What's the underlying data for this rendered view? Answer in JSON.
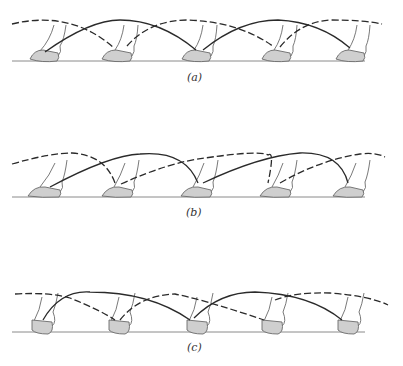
{
  "figure": {
    "panels": [
      {
        "id": "a",
        "label": "(a)",
        "ground_y": 61,
        "hooves_x": [
          42,
          121,
          200,
          280,
          352
        ]
      },
      {
        "id": "b",
        "label": "(b)",
        "ground_y": 197,
        "hooves_x": [
          42,
          116,
          197,
          276,
          350
        ]
      },
      {
        "id": "c",
        "label": "(c)",
        "ground_y": 332,
        "hooves_x": [
          40,
          117,
          196,
          272,
          348
        ]
      }
    ],
    "colors": {
      "hoof_fill": "#cfcfcf",
      "line": "#2a2a2a",
      "ground": "#8a8a8a"
    }
  }
}
